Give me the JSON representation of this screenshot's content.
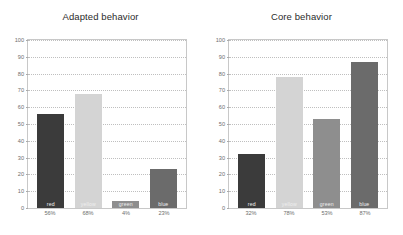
{
  "chart_data": [
    {
      "type": "bar",
      "title": "Adapted behavior",
      "xlabel": "",
      "ylabel": "",
      "ylim": [
        0,
        100
      ],
      "yticks": [
        0,
        10,
        20,
        30,
        40,
        50,
        60,
        70,
        80,
        90,
        100
      ],
      "grid": true,
      "legend": "none",
      "categories": [
        "red",
        "yellow",
        "green",
        "blue"
      ],
      "values": [
        56,
        68,
        4,
        23
      ],
      "data_labels": [
        "56%",
        "68%",
        "4%",
        "23%"
      ],
      "colors": [
        "#3b3b3b",
        "#d4d4d4",
        "#8e8e8e",
        "#6b6b6b"
      ]
    },
    {
      "type": "bar",
      "title": "Core behavior",
      "xlabel": "",
      "ylabel": "",
      "ylim": [
        0,
        100
      ],
      "yticks": [
        0,
        10,
        20,
        30,
        40,
        50,
        60,
        70,
        80,
        90,
        100
      ],
      "grid": true,
      "legend": "none",
      "categories": [
        "red",
        "yellow",
        "green",
        "blue"
      ],
      "values": [
        32,
        78,
        53,
        87
      ],
      "data_labels": [
        "32%",
        "78%",
        "53%",
        "87%"
      ],
      "colors": [
        "#3b3b3b",
        "#d4d4d4",
        "#8e8e8e",
        "#6b6b6b"
      ]
    }
  ]
}
